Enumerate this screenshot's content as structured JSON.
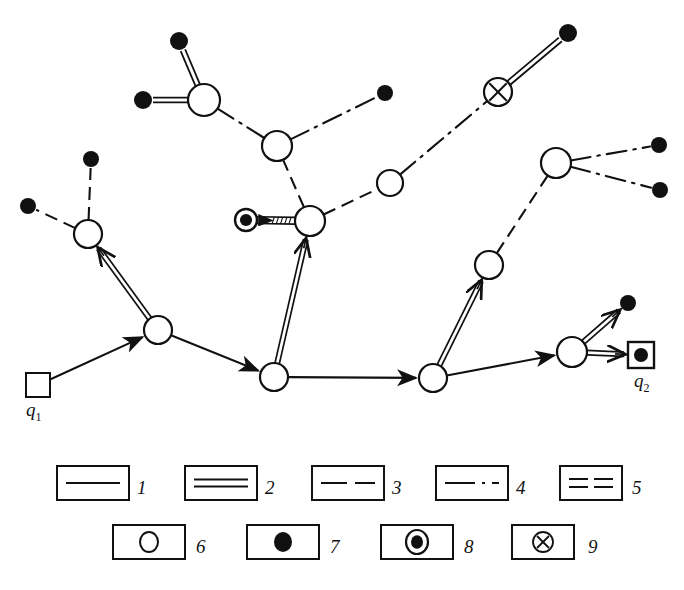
{
  "figure": {
    "type": "network-diagram",
    "background": "#ffffff",
    "stroke_color": "#111111"
  },
  "markers": {
    "source": {
      "id": "q1",
      "label": "q",
      "sub": "1",
      "shape": "open-square",
      "x": 38,
      "y": 385,
      "size": 24,
      "label_x": 26,
      "label_y": 401
    },
    "destination": {
      "id": "q2",
      "label": "q",
      "sub": "2",
      "shape": "square-with-filled-dot",
      "x": 641,
      "y": 355,
      "size": 26,
      "label_x": 634,
      "label_y": 372
    }
  },
  "nodes": [
    {
      "id": "n1",
      "name": "node-upper-left-hub",
      "type": "open-circle",
      "x": 88,
      "y": 234,
      "r": 14
    },
    {
      "id": "n2",
      "name": "node-left-junction",
      "type": "open-circle",
      "x": 158,
      "y": 330,
      "r": 14
    },
    {
      "id": "n3",
      "name": "node-center-bottom",
      "type": "open-circle",
      "x": 274,
      "y": 377,
      "r": 14
    },
    {
      "id": "n4",
      "name": "node-center-hatched-hub",
      "type": "open-circle",
      "x": 310,
      "y": 221,
      "r": 15
    },
    {
      "id": "n5",
      "name": "node-center-upper",
      "type": "open-circle",
      "x": 277,
      "y": 146,
      "r": 15
    },
    {
      "id": "n6",
      "name": "node-upper-left-star",
      "type": "open-circle",
      "x": 204,
      "y": 100,
      "r": 16
    },
    {
      "id": "n7",
      "name": "node-mid-right",
      "type": "open-circle",
      "x": 390,
      "y": 183,
      "r": 13
    },
    {
      "id": "n8",
      "name": "node-right-bottom",
      "type": "open-circle",
      "x": 433,
      "y": 378,
      "r": 14
    },
    {
      "id": "n9",
      "name": "node-right-middle",
      "type": "open-circle",
      "x": 489,
      "y": 265,
      "r": 14
    },
    {
      "id": "n10",
      "name": "node-right-star",
      "type": "open-circle",
      "x": 556,
      "y": 163,
      "r": 15
    },
    {
      "id": "n11",
      "name": "node-right-lower",
      "type": "open-circle",
      "x": 572,
      "y": 352,
      "r": 15
    },
    {
      "id": "x1",
      "name": "node-crossed-circle",
      "type": "crossed-circle",
      "x": 498,
      "y": 92,
      "r": 14
    }
  ],
  "terminals": [
    {
      "id": "t1",
      "name": "terminal-top-left-upper",
      "type": "filled-dot",
      "x": 91,
      "y": 159,
      "r": 8
    },
    {
      "id": "t2",
      "name": "terminal-top-left-west",
      "type": "filled-dot",
      "x": 28,
      "y": 206,
      "r": 8
    },
    {
      "id": "t3",
      "name": "terminal-north-upper",
      "type": "filled-dot",
      "x": 179,
      "y": 41,
      "r": 9
    },
    {
      "id": "t4",
      "name": "terminal-north-west",
      "type": "filled-dot",
      "x": 143,
      "y": 100,
      "r": 9
    },
    {
      "id": "t5",
      "name": "terminal-center-east",
      "type": "filled-dot",
      "x": 385,
      "y": 93,
      "r": 8
    },
    {
      "id": "t6",
      "name": "terminal-crossed-northeast",
      "type": "filled-dot",
      "x": 568,
      "y": 33,
      "r": 9
    },
    {
      "id": "t7",
      "name": "terminal-right-upper",
      "type": "filled-dot",
      "x": 659,
      "y": 145,
      "r": 8
    },
    {
      "id": "t8",
      "name": "terminal-right-lower",
      "type": "filled-dot",
      "x": 660,
      "y": 190,
      "r": 8
    },
    {
      "id": "t9",
      "name": "terminal-q2-north",
      "type": "filled-dot",
      "x": 628,
      "y": 303,
      "r": 8
    },
    {
      "id": "b1",
      "name": "terminal-bullseye-center",
      "type": "bullseye",
      "x": 246,
      "y": 220,
      "r": 11
    }
  ],
  "links": [
    {
      "id": "l1",
      "name": "link-q1-to-n2",
      "style": "solid-arrow",
      "from": "q1",
      "to": "n2"
    },
    {
      "id": "l2",
      "name": "link-n2-to-n1",
      "style": "double-arrow",
      "from": "n2",
      "to": "n1"
    },
    {
      "id": "l3",
      "name": "link-n1-to-t1",
      "style": "dashed",
      "from": "n1",
      "to": "t1"
    },
    {
      "id": "l4",
      "name": "link-n1-to-t2",
      "style": "dashed",
      "from": "n1",
      "to": "t2"
    },
    {
      "id": "l5",
      "name": "link-n2-to-n3",
      "style": "solid-arrow",
      "from": "n2",
      "to": "n3"
    },
    {
      "id": "l6",
      "name": "link-n3-to-n4",
      "style": "double-arrow",
      "from": "n3",
      "to": "n4"
    },
    {
      "id": "l7",
      "name": "link-n3-to-n8",
      "style": "solid-arrow",
      "from": "n3",
      "to": "n8"
    },
    {
      "id": "l8",
      "name": "link-n4-to-bullseye",
      "style": "hatched-arrow",
      "from": "n4",
      "to": "b1"
    },
    {
      "id": "l9",
      "name": "link-n4-to-n5",
      "style": "dashed",
      "from": "n4",
      "to": "n5"
    },
    {
      "id": "l10",
      "name": "link-n4-to-n7",
      "style": "dashed",
      "from": "n4",
      "to": "n7"
    },
    {
      "id": "l11",
      "name": "link-n5-to-n6",
      "style": "dash-dot",
      "from": "n5",
      "to": "n6"
    },
    {
      "id": "l12",
      "name": "link-n5-to-t5",
      "style": "dash-dot",
      "from": "n5",
      "to": "t5"
    },
    {
      "id": "l13",
      "name": "link-n6-to-t3",
      "style": "double-line",
      "from": "n6",
      "to": "t3"
    },
    {
      "id": "l14",
      "name": "link-n6-to-t4",
      "style": "double-line",
      "from": "n6",
      "to": "t4"
    },
    {
      "id": "l15",
      "name": "link-n7-to-x1",
      "style": "dash-dot",
      "from": "n7",
      "to": "x1"
    },
    {
      "id": "l16",
      "name": "link-x1-to-t6",
      "style": "double-line",
      "from": "x1",
      "to": "t6"
    },
    {
      "id": "l17",
      "name": "link-n8-to-n9",
      "style": "double-arrow",
      "from": "n8",
      "to": "n9"
    },
    {
      "id": "l18",
      "name": "link-n9-to-n10",
      "style": "dashed",
      "from": "n9",
      "to": "n10"
    },
    {
      "id": "l19",
      "name": "link-n10-to-t7",
      "style": "dash-dot",
      "from": "n10",
      "to": "t7"
    },
    {
      "id": "l20",
      "name": "link-n10-to-t8",
      "style": "dash-dot",
      "from": "n10",
      "to": "t8"
    },
    {
      "id": "l21",
      "name": "link-n8-to-n11",
      "style": "solid-arrow",
      "from": "n8",
      "to": "n11"
    },
    {
      "id": "l22",
      "name": "link-n11-to-t9",
      "style": "double-arrow",
      "from": "n11",
      "to": "t9"
    },
    {
      "id": "l23",
      "name": "link-n11-to-q2",
      "style": "double-arrow",
      "from": "n11",
      "to": "q2"
    }
  ],
  "legend": {
    "row1": [
      {
        "num": "1",
        "name": "legend-solid-line",
        "style": "solid",
        "box_x": 57,
        "box_y": 466,
        "box_w": 72,
        "box_h": 34,
        "num_x": 137,
        "num_y": 496
      },
      {
        "num": "2",
        "name": "legend-double-line",
        "style": "double",
        "box_x": 185,
        "box_y": 466,
        "box_w": 72,
        "box_h": 34,
        "num_x": 265,
        "num_y": 496
      },
      {
        "num": "3",
        "name": "legend-dashed-line",
        "style": "dashed",
        "box_x": 312,
        "box_y": 466,
        "box_w": 72,
        "box_h": 34,
        "num_x": 392,
        "num_y": 496
      },
      {
        "num": "4",
        "name": "legend-dash-dot-line",
        "style": "dashdot",
        "box_x": 436,
        "box_y": 466,
        "box_w": 72,
        "box_h": 34,
        "num_x": 516,
        "num_y": 496
      },
      {
        "num": "5",
        "name": "legend-double-dash",
        "style": "doubledash",
        "box_x": 560,
        "box_y": 466,
        "box_w": 62,
        "box_h": 34,
        "num_x": 632,
        "num_y": 496
      }
    ],
    "row2": [
      {
        "num": "6",
        "name": "legend-open-circle",
        "style": "open-circle",
        "box_x": 113,
        "box_y": 525,
        "box_w": 72,
        "box_h": 34,
        "num_x": 196,
        "num_y": 555
      },
      {
        "num": "7",
        "name": "legend-filled-circle",
        "style": "filled-circle",
        "box_x": 247,
        "box_y": 525,
        "box_w": 72,
        "box_h": 34,
        "num_x": 330,
        "num_y": 555
      },
      {
        "num": "8",
        "name": "legend-bullseye",
        "style": "bullseye",
        "box_x": 381,
        "box_y": 525,
        "box_w": 72,
        "box_h": 34,
        "num_x": 464,
        "num_y": 555
      },
      {
        "num": "9",
        "name": "legend-crossed-circle",
        "style": "crossed-circle",
        "box_x": 512,
        "box_y": 525,
        "box_w": 62,
        "box_h": 34,
        "num_x": 588,
        "num_y": 555
      }
    ]
  }
}
